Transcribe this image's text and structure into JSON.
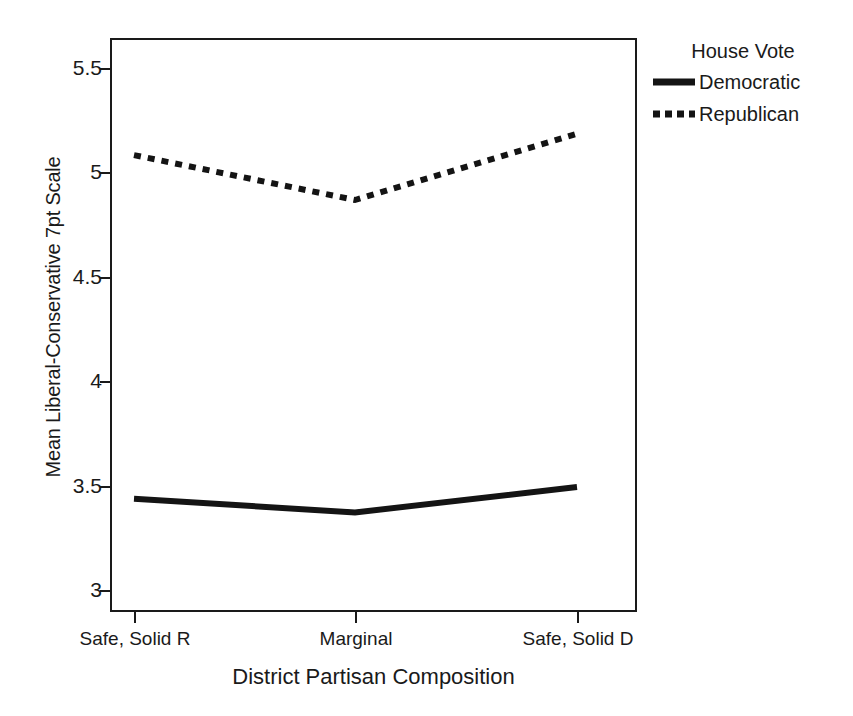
{
  "chart_data": {
    "type": "line",
    "title": "",
    "xlabel": "District Partisan Composition",
    "ylabel": "Mean Liberal-Conservative 7pt Scale",
    "categories": [
      "Safe, Solid R",
      "Marginal",
      "Safe, Solid D"
    ],
    "ylim": [
      2.78,
      5.72
    ],
    "yticks": [
      "3",
      "3.5",
      "4",
      "4.5",
      "5",
      "5.5"
    ],
    "ytick_values": [
      3,
      3.5,
      4,
      4.5,
      5,
      5.5
    ],
    "grid": false,
    "legend_position": "right",
    "series": [
      {
        "name": "Democratic",
        "values": [
          3.36,
          3.29,
          3.42
        ],
        "style": "solid",
        "color": "#141414"
      },
      {
        "name": "Republican",
        "values": [
          5.12,
          4.89,
          5.23
        ],
        "style": "dotted",
        "color": "#141414"
      }
    ]
  },
  "legend": {
    "title": "House Vote",
    "entries": [
      {
        "label": "Democratic",
        "swatch": "solid-line-swatch"
      },
      {
        "label": "Republican",
        "swatch": "dotted-line-swatch"
      }
    ]
  },
  "axes": {
    "y_title": "Mean Liberal-Conservative 7pt Scale",
    "x_title": "District Partisan Composition",
    "y_tick_labels": [
      "5.5",
      "5",
      "4.5",
      "4",
      "3.5",
      "3"
    ],
    "x_tick_labels": [
      "Safe, Solid R",
      "Marginal",
      "Safe, Solid D"
    ]
  }
}
